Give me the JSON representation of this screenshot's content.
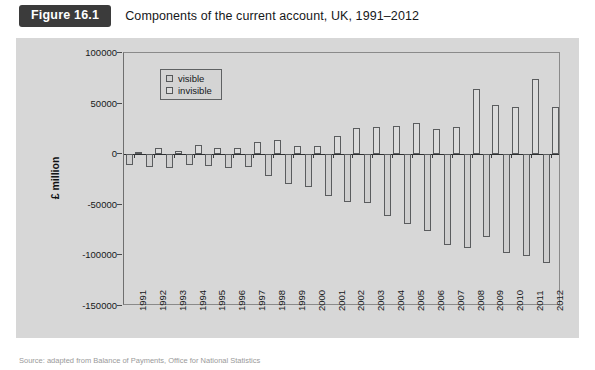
{
  "figure": {
    "tag": "Figure 16.1",
    "caption": "Components of the current account, UK, 1991–2012"
  },
  "source_note": "Source: adapted from Balance of Payments, Office for National Statistics",
  "legend": {
    "position": "top-left-inside",
    "entries": [
      {
        "label": "visible",
        "swatch_color": "#cfcfcf",
        "icon": "legend-swatch-icon"
      },
      {
        "label": "invisible",
        "swatch_color": "#dcdcdc",
        "icon": "legend-swatch-icon"
      }
    ]
  },
  "chart_data": {
    "type": "bar",
    "title": "Components of the current account, UK, 1991–2012",
    "xlabel": "",
    "ylabel": "£ million",
    "ylim": [
      -150000,
      100000
    ],
    "yticks": [
      100000,
      50000,
      0,
      -50000,
      -100000,
      -150000
    ],
    "ytick_labels": [
      "100000",
      "50000",
      "0",
      "-50000",
      "-100000",
      "-150000"
    ],
    "grid": false,
    "legend_position": "upper left",
    "categories": [
      "1991",
      "1992",
      "1993",
      "1994",
      "1995",
      "1996",
      "1997",
      "1998",
      "1999",
      "2000",
      "2001",
      "2002",
      "2003",
      "2004",
      "2005",
      "2006",
      "2007",
      "2008",
      "2009",
      "2010",
      "2011",
      "2012"
    ],
    "series": [
      {
        "name": "visible",
        "values": [
          -10200,
          -13100,
          -13400,
          -11100,
          -12000,
          -13700,
          -12300,
          -21800,
          -29000,
          -32900,
          -41000,
          -47600,
          -48600,
          -60700,
          -68600,
          -76300,
          -89800,
          -93000,
          -82000,
          -97500,
          -100400,
          -108000
        ]
      },
      {
        "name": "invisible",
        "values": [
          2400,
          5900,
          3200,
          9100,
          5800,
          6200,
          12200,
          14400,
          7700,
          8500,
          17900,
          26000,
          27100,
          27600,
          30600,
          24900,
          27300,
          64300,
          48800,
          46900,
          74200,
          46400
        ]
      }
    ]
  }
}
